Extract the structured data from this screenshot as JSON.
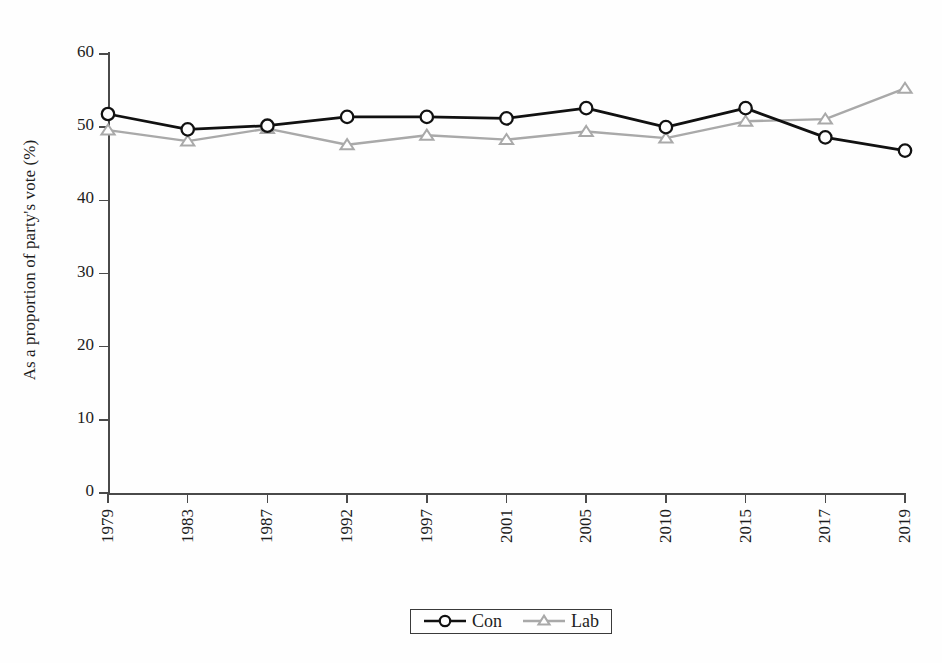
{
  "chart_data": {
    "type": "line",
    "title": "",
    "subtitle": "",
    "xlabel": "",
    "ylabel": "As a proportion of party's vote (%)",
    "categories": [
      "1979",
      "1983",
      "1987",
      "1992",
      "1997",
      "2001",
      "2005",
      "2010",
      "2015",
      "2017",
      "2019"
    ],
    "series": [
      {
        "name": "Con",
        "color": "#111111",
        "marker": "circle-open",
        "values": [
          51.8,
          49.7,
          50.2,
          51.4,
          51.4,
          51.2,
          52.6,
          50.0,
          52.6,
          48.6,
          46.8
        ]
      },
      {
        "name": "Lab",
        "color": "#a9a9a9",
        "marker": "triangle-open",
        "values": [
          49.6,
          48.1,
          49.8,
          47.6,
          48.9,
          48.3,
          49.4,
          48.5,
          50.8,
          51.1,
          55.3
        ]
      }
    ],
    "ylim": [
      0,
      60
    ],
    "yticks": [
      0,
      10,
      20,
      30,
      40,
      50,
      60
    ],
    "ytick_labels": [
      "0",
      "10",
      "20",
      "30",
      "40",
      "50",
      "60"
    ],
    "grid": false,
    "legend": {
      "position": "bottom-center",
      "entries": [
        "Con",
        "Lab"
      ]
    }
  },
  "legend": {
    "con_label": "Con",
    "lab_label": "Lab"
  },
  "axes": {
    "y_title": "As a proportion of party's vote (%)"
  }
}
